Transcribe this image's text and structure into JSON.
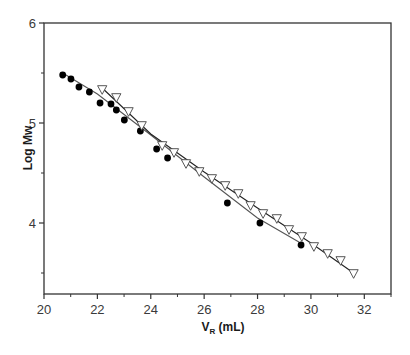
{
  "chart_data": {
    "type": "scatter",
    "title": "",
    "xlabel": "V_R (mL)",
    "xlabel_main": "V",
    "xlabel_sub": "R",
    "xlabel_unit": " (mL)",
    "ylabel": "Log Mw",
    "xlim": [
      20,
      33
    ],
    "ylim": [
      3.29,
      6
    ],
    "x_ticks": [
      20,
      22,
      24,
      26,
      28,
      30,
      32
    ],
    "x_minor_ticks": [
      21,
      23,
      25,
      27,
      29,
      31,
      33
    ],
    "y_ticks": [
      4,
      5,
      6
    ],
    "y_minor_ticks": [
      3.5,
      4.5,
      5.5
    ],
    "grid": false,
    "legend": null,
    "series": [
      {
        "name": "filled circles",
        "marker": "filled-circle",
        "color": "#000000",
        "fit_line": true,
        "x": [
          20.7,
          21.01,
          21.31,
          21.7,
          22.1,
          22.51,
          22.71,
          23.01,
          23.61,
          24.22,
          24.63,
          26.87,
          28.09,
          29.63
        ],
        "y": [
          5.48,
          5.44,
          5.36,
          5.31,
          5.2,
          5.19,
          5.13,
          5.03,
          4.92,
          4.74,
          4.65,
          4.2,
          4.0,
          3.78
        ]
      },
      {
        "name": "open triangles",
        "marker": "open-down-triangle",
        "color": "#444444",
        "fit_line": true,
        "x": [
          22.18,
          22.71,
          23.17,
          23.66,
          24.43,
          24.87,
          25.32,
          25.82,
          26.29,
          26.79,
          27.28,
          27.74,
          28.21,
          28.72,
          29.18,
          29.66,
          30.11,
          30.63,
          31.11,
          31.6
        ],
        "y": [
          5.33,
          5.25,
          5.11,
          4.97,
          4.77,
          4.7,
          4.59,
          4.51,
          4.44,
          4.37,
          4.29,
          4.17,
          4.09,
          4.04,
          3.93,
          3.86,
          3.76,
          3.69,
          3.62,
          3.49
        ]
      }
    ],
    "fit_lines": [
      {
        "series": "filled circles",
        "color": "#555555",
        "points": [
          [
            20.7,
            5.5
          ],
          [
            22.0,
            5.29
          ],
          [
            24.0,
            4.88
          ],
          [
            26.0,
            4.46
          ],
          [
            28.0,
            4.05
          ],
          [
            29.55,
            3.81
          ]
        ]
      },
      {
        "series": "open triangles",
        "color": "#222222",
        "points": [
          [
            22.18,
            5.35
          ],
          [
            24.0,
            4.89
          ],
          [
            26.0,
            4.51
          ],
          [
            28.0,
            4.15
          ],
          [
            30.0,
            3.8
          ],
          [
            31.6,
            3.5
          ]
        ]
      }
    ]
  },
  "axes": {
    "frame_color": "#333333"
  }
}
